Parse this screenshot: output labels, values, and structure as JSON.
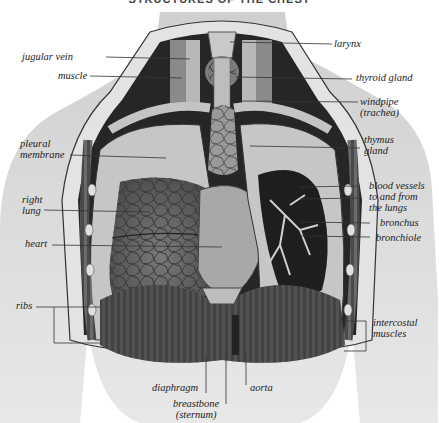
{
  "title": "STRUCTURES OF THE CHEST",
  "labels_left": [
    {
      "id": "jugular-vein",
      "text": "jugular vein"
    },
    {
      "id": "muscle",
      "text": "muscle"
    },
    {
      "id": "pleural-membrane",
      "line1": "pleural",
      "line2": "membrane"
    },
    {
      "id": "right-lung",
      "line1": "right",
      "line2": "lung"
    },
    {
      "id": "heart",
      "text": "heart"
    },
    {
      "id": "ribs",
      "text": "ribs"
    }
  ],
  "labels_right": [
    {
      "id": "larynx",
      "text": "larynx"
    },
    {
      "id": "thyroid-gland",
      "text": "thyroid gland"
    },
    {
      "id": "windpipe",
      "line1": "windpipe",
      "line2": "(trachea)"
    },
    {
      "id": "thymus-gland",
      "line1": "thymus",
      "line2": "gland"
    },
    {
      "id": "blood-vessels",
      "line1": "blood vessels",
      "line2": "to and from",
      "line3": "the lungs"
    },
    {
      "id": "bronchus",
      "text": "bronchus"
    },
    {
      "id": "bronchiole",
      "text": "bronchiole"
    },
    {
      "id": "intercostal-muscles",
      "line1": "intercostal",
      "line2": "muscles"
    }
  ],
  "labels_bottom": [
    {
      "id": "diaphragm",
      "text": "diaphragm"
    },
    {
      "id": "breastbone",
      "line1": "breastbone",
      "line2": "(sternum)"
    },
    {
      "id": "aorta",
      "text": "aorta"
    }
  ],
  "colors": {
    "skin": "#d6d6d6",
    "cavity": "#2a2a2a",
    "lung": "#6b6b6b",
    "pleura": "#bdbdbd",
    "line": "#333333"
  }
}
